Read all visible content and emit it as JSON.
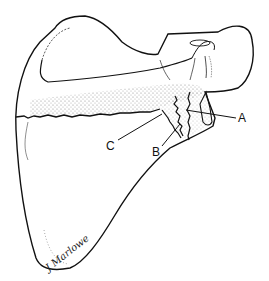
{
  "figure": {
    "labels": [
      {
        "id": "A",
        "text": "A"
      },
      {
        "id": "B",
        "text": "B"
      },
      {
        "id": "C",
        "text": "C"
      }
    ],
    "signature": "J Marlowe",
    "colors": {
      "line": "#111111",
      "stipple": "#9a9a9a",
      "background": "#ffffff"
    }
  }
}
